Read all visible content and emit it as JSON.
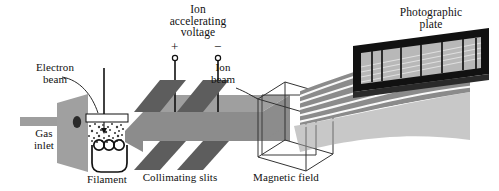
{
  "figure": {
    "width": 499,
    "height": 191,
    "background": "#ffffff"
  },
  "labels": {
    "gas_inlet": "Gas\ninlet",
    "electron_beam": "Electron\nbeam",
    "filament": "Filament",
    "ion_accelerating_voltage": "Ion\naccelerating\nvoltage",
    "collimating_slits": "Collimating slits",
    "ion_beam": "Ion\nbeam",
    "magnetic_field": "Magnetic field",
    "photographic_plate": "Photographic\nplate",
    "plus_sign": "+",
    "minus_sign": "−"
  },
  "colors": {
    "ink": "#111111",
    "beam_gray": "#8c8c8c",
    "beam_gray_light": "#9a9a9a",
    "slit_dark": "#5d5d5d",
    "slit_mid": "#6e6e6e",
    "plate_gray": "#9b9b9b",
    "inlet_gray": "#9e9e9e",
    "frame_black": "#111111",
    "white": "#ffffff"
  },
  "components": [
    {
      "name": "gas-inlet-tube",
      "label": "Gas inlet"
    },
    {
      "name": "ionization-plate",
      "label": ""
    },
    {
      "name": "filament-coil",
      "label": "Filament"
    },
    {
      "name": "electron-source-box",
      "label": "Electron beam"
    },
    {
      "name": "accelerating-electrode-positive",
      "label": "+"
    },
    {
      "name": "accelerating-electrode-negative",
      "label": "−"
    },
    {
      "name": "collimating-slit-1",
      "label": "Collimating slits"
    },
    {
      "name": "collimating-slit-2",
      "label": "Collimating slits"
    },
    {
      "name": "ion-beam-path",
      "label": "Ion beam"
    },
    {
      "name": "magnetic-field-cube",
      "label": "Magnetic field"
    },
    {
      "name": "photographic-plate-frame",
      "label": "Photographic plate"
    }
  ],
  "spectral_lines": {
    "count": 7,
    "description": "vertical spectral line marks on photographic plate"
  },
  "beam_trajectories": {
    "count": 6,
    "description": "fanned ion trajectories curving from magnetic field to plate"
  }
}
